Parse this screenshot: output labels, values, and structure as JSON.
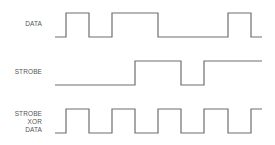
{
  "diagram": {
    "type": "timing-diagram",
    "stroke_color": "#6e6e6e",
    "label_color": "#555555",
    "signals": [
      {
        "name": "DATA",
        "label_lines": [
          "DATA"
        ],
        "high_y": 13,
        "low_y": 37,
        "start_x": 55,
        "end_x": 262,
        "initial_level": 0,
        "transitions_x": [
          66,
          89,
          112,
          158,
          228,
          251
        ]
      },
      {
        "name": "STROBE",
        "label_lines": [
          "STROBE"
        ],
        "high_y": 61,
        "low_y": 85,
        "start_x": 55,
        "end_x": 262,
        "initial_level": 0,
        "transitions_x": [
          135,
          181,
          204
        ]
      },
      {
        "name": "STROBE XOR DATA",
        "label_lines": [
          "STROBE",
          "XOR",
          "DATA"
        ],
        "high_y": 109,
        "low_y": 133,
        "start_x": 55,
        "end_x": 262,
        "initial_level": 0,
        "transitions_x": [
          66,
          89,
          112,
          135,
          158,
          181,
          204,
          228,
          251
        ]
      }
    ]
  },
  "labels": {
    "data": "DATA",
    "strobe": "STROBE",
    "xor_line1": "STROBE",
    "xor_line2": "XOR",
    "xor_line3": "DATA"
  }
}
